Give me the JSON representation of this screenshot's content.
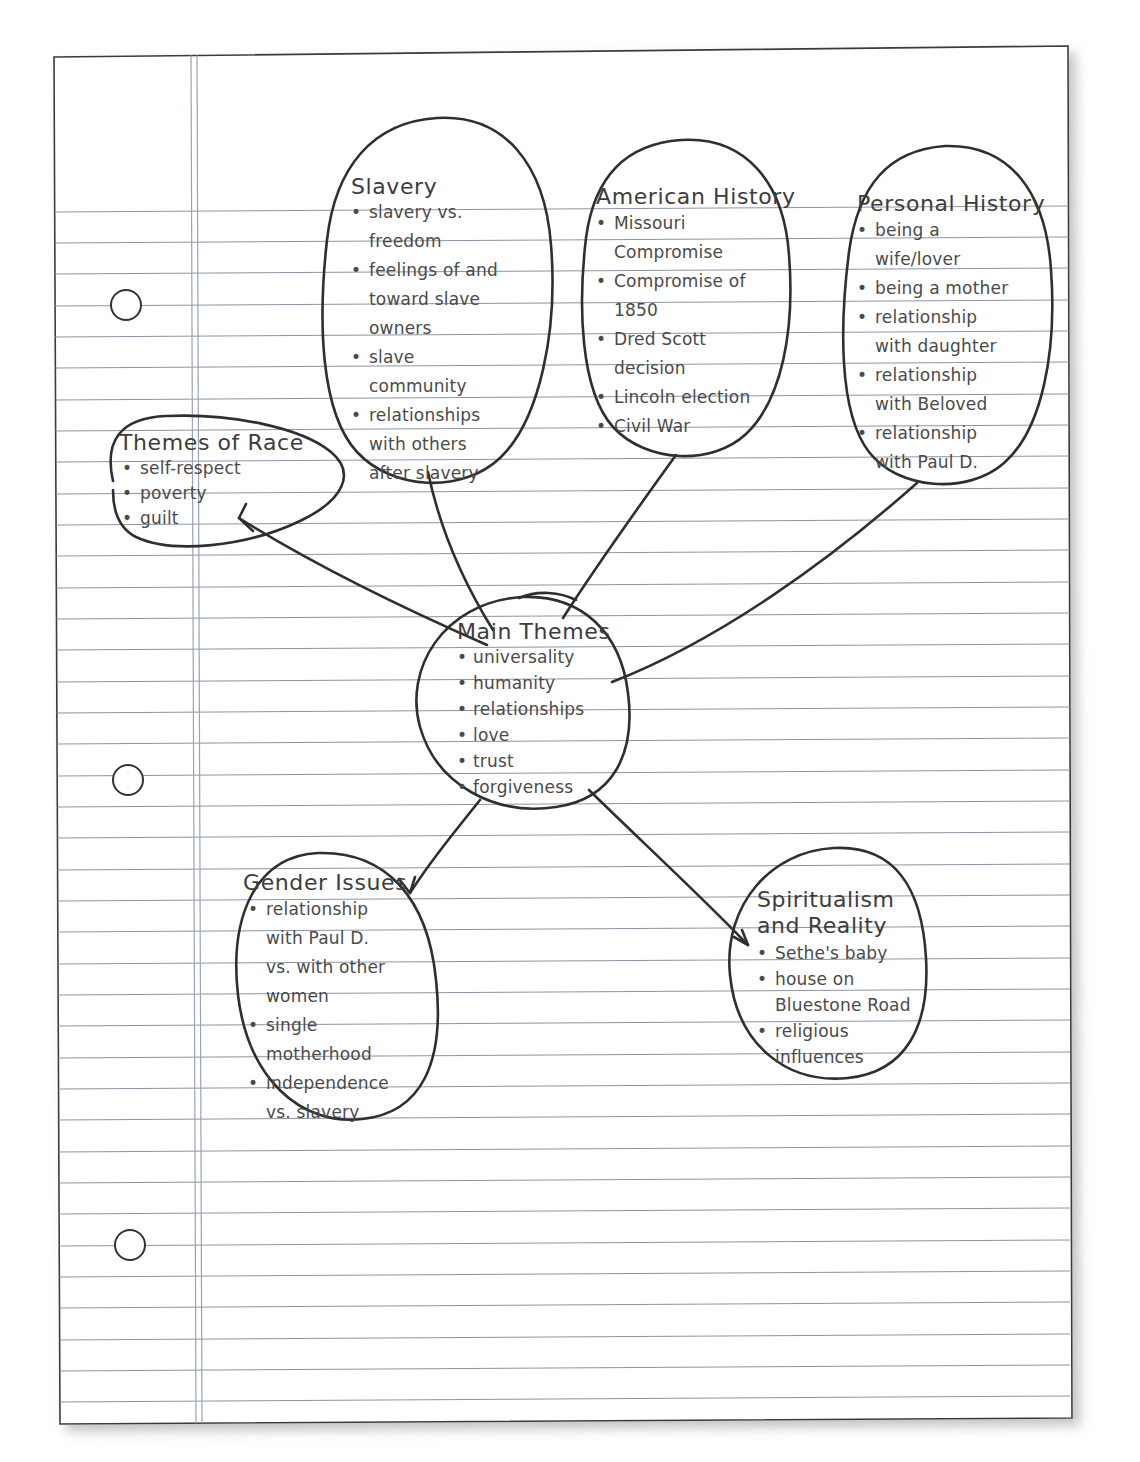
{
  "document": {
    "kind": "handwritten-mind-map",
    "paper": {
      "type": "college-ruled-loose-leaf",
      "holes": 3,
      "margin_rule": "double vertical red-line margin",
      "ink_color": "#2f2f2f",
      "rule_color": "#8d95a6",
      "paper_color": "#ffffff"
    }
  },
  "center_node": {
    "title": "Main Themes",
    "items": [
      "universality",
      "humanity",
      "relationships",
      "love",
      "trust",
      "forgiveness"
    ]
  },
  "nodes": [
    {
      "id": "themes-of-race",
      "title": "Themes of Race",
      "items": [
        "self-respect",
        "poverty",
        "guilt"
      ]
    },
    {
      "id": "slavery",
      "title": "Slavery",
      "items": [
        "slavery vs.",
        "freedom",
        "feelings of and",
        "toward slave",
        "owners",
        "slave",
        "community",
        "relationships",
        "with others",
        "after slavery"
      ]
    },
    {
      "id": "american-history",
      "title": "American History",
      "items": [
        "Missouri",
        "Compromise",
        "Compromise of",
        "1850",
        "Dred Scott",
        "decision",
        "Lincoln election",
        "Civil War"
      ]
    },
    {
      "id": "personal-history",
      "title": "Personal History",
      "items": [
        "being a",
        "wife/lover",
        "being a mother",
        "relationship",
        "with daughter",
        "relationship",
        "with Beloved",
        "relationship",
        "with Paul D."
      ]
    },
    {
      "id": "gender-issues",
      "title": "Gender Issues",
      "items": [
        "relationship",
        "with Paul D.",
        "vs. with other",
        "women",
        "single",
        "motherhood",
        "independence",
        "vs. slavery"
      ]
    },
    {
      "id": "spiritualism-and-reality",
      "title_line_1": "Spiritualism",
      "title_line_2": "and Reality",
      "items": [
        "Sethe's baby",
        "house on",
        "Bluestone Road",
        "religious",
        "influences"
      ]
    }
  ],
  "text_lines": {
    "slavery": [
      {
        "bullet": true,
        "text": "slavery vs."
      },
      {
        "bullet": false,
        "text": "freedom"
      },
      {
        "bullet": true,
        "text": "feelings of and"
      },
      {
        "bullet": false,
        "text": "toward slave"
      },
      {
        "bullet": false,
        "text": "owners"
      },
      {
        "bullet": true,
        "text": "slave"
      },
      {
        "bullet": false,
        "text": "community"
      },
      {
        "bullet": true,
        "text": "relationships"
      },
      {
        "bullet": false,
        "text": "with others"
      },
      {
        "bullet": false,
        "text": "after slavery"
      }
    ],
    "american_history": [
      {
        "bullet": true,
        "text": "Missouri"
      },
      {
        "bullet": false,
        "text": "Compromise"
      },
      {
        "bullet": true,
        "text": "Compromise of"
      },
      {
        "bullet": false,
        "text": "1850"
      },
      {
        "bullet": true,
        "text": "Dred Scott"
      },
      {
        "bullet": false,
        "text": "decision"
      },
      {
        "bullet": true,
        "text": "Lincoln election"
      },
      {
        "bullet": true,
        "text": "Civil War"
      }
    ],
    "personal_history": [
      {
        "bullet": true,
        "text": "being a"
      },
      {
        "bullet": false,
        "text": "wife/lover"
      },
      {
        "bullet": true,
        "text": "being a mother"
      },
      {
        "bullet": true,
        "text": "relationship"
      },
      {
        "bullet": false,
        "text": "with daughter"
      },
      {
        "bullet": true,
        "text": "relationship"
      },
      {
        "bullet": false,
        "text": "with Beloved"
      },
      {
        "bullet": true,
        "text": "relationship"
      },
      {
        "bullet": false,
        "text": "with Paul D."
      }
    ],
    "themes_of_race": [
      {
        "bullet": true,
        "text": "self-respect"
      },
      {
        "bullet": true,
        "text": "poverty"
      },
      {
        "bullet": true,
        "text": "guilt"
      }
    ],
    "main_themes": [
      {
        "bullet": true,
        "text": "universality"
      },
      {
        "bullet": true,
        "text": "humanity"
      },
      {
        "bullet": true,
        "text": "relationships"
      },
      {
        "bullet": true,
        "text": "love"
      },
      {
        "bullet": true,
        "text": "trust"
      },
      {
        "bullet": true,
        "text": "forgiveness"
      }
    ],
    "gender_issues": [
      {
        "bullet": true,
        "text": "relationship"
      },
      {
        "bullet": false,
        "text": "with Paul D."
      },
      {
        "bullet": false,
        "text": "vs. with other"
      },
      {
        "bullet": false,
        "text": "women"
      },
      {
        "bullet": true,
        "text": "single"
      },
      {
        "bullet": false,
        "text": "motherhood"
      },
      {
        "bullet": true,
        "text": "independence"
      },
      {
        "bullet": false,
        "text": "vs. slavery"
      }
    ],
    "spiritualism": [
      {
        "bullet": true,
        "text": "Sethe's baby"
      },
      {
        "bullet": true,
        "text": "house on"
      },
      {
        "bullet": false,
        "text": "Bluestone Road"
      },
      {
        "bullet": true,
        "text": "religious"
      },
      {
        "bullet": false,
        "text": "influences"
      }
    ]
  },
  "connections": [
    {
      "from": "main-themes",
      "to": "themes-of-race"
    },
    {
      "from": "main-themes",
      "to": "slavery"
    },
    {
      "from": "main-themes",
      "to": "american-history"
    },
    {
      "from": "main-themes",
      "to": "personal-history"
    },
    {
      "from": "main-themes",
      "to": "gender-issues"
    },
    {
      "from": "main-themes",
      "to": "spiritualism-and-reality"
    }
  ]
}
